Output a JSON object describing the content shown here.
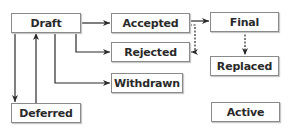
{
  "diagram": {
    "type": "state-transition",
    "nodes": {
      "draft": "Draft",
      "accepted": "Accepted",
      "rejected": "Rejected",
      "withdrawn": "Withdrawn",
      "final": "Final",
      "replaced": "Replaced",
      "deferred": "Deferred",
      "active": "Active"
    },
    "edges": [
      {
        "from": "Draft",
        "to": "Accepted",
        "style": "solid"
      },
      {
        "from": "Draft",
        "to": "Rejected",
        "style": "solid"
      },
      {
        "from": "Draft",
        "to": "Withdrawn",
        "style": "solid"
      },
      {
        "from": "Draft",
        "to": "Deferred",
        "style": "solid"
      },
      {
        "from": "Deferred",
        "to": "Draft",
        "style": "solid"
      },
      {
        "from": "Accepted",
        "to": "Final",
        "style": "solid"
      },
      {
        "from": "Accepted",
        "to": "Rejected",
        "style": "dashed"
      },
      {
        "from": "Final",
        "to": "Replaced",
        "style": "dashed"
      }
    ],
    "colors": {
      "line": "#2a2a2a",
      "border": "#8a8a8a",
      "text": "#2a2a2a"
    }
  }
}
